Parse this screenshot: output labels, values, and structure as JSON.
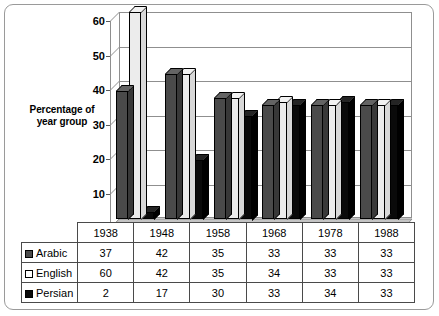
{
  "chart_data": {
    "type": "bar",
    "title": "",
    "subtitle": "",
    "xlabel": "",
    "ylabel": "Percentage of\nyear group",
    "ylabel_lines": [
      "Percentage of",
      "year group"
    ],
    "categories": [
      "1938",
      "1948",
      "1958",
      "1968",
      "1978",
      "1988"
    ],
    "series": [
      {
        "name": "Arabic",
        "values": [
          37,
          42,
          35,
          33,
          33,
          33
        ],
        "color": "#4a4a4a",
        "swatch": "gray-swatch"
      },
      {
        "name": "English",
        "values": [
          60,
          42,
          35,
          34,
          33,
          33
        ],
        "color": "#ffffff",
        "swatch": "white-swatch"
      },
      {
        "name": "Persian",
        "values": [
          2,
          17,
          30,
          33,
          34,
          33
        ],
        "color": "#0a0a0a",
        "swatch": "black-swatch"
      }
    ],
    "ylim": [
      0,
      60
    ],
    "ytick_values": [
      0,
      10,
      20,
      30,
      40,
      50,
      60
    ],
    "ytick_labels": [
      "0",
      "10",
      "20",
      "30",
      "40",
      "50",
      "60"
    ],
    "grid": true,
    "grid_axis": "y",
    "legend_position": "table-row-headers",
    "style": "3d-clustered-column",
    "has_data_table": true
  },
  "table": {
    "column_headers": [
      "1938",
      "1948",
      "1958",
      "1968",
      "1978",
      "1988"
    ],
    "rows": [
      {
        "label": "Arabic",
        "values": [
          "37",
          "42",
          "35",
          "33",
          "33",
          "33"
        ]
      },
      {
        "label": "English",
        "values": [
          "60",
          "42",
          "35",
          "34",
          "33",
          "33"
        ]
      },
      {
        "label": "Persian",
        "values": [
          "2",
          "17",
          "30",
          "33",
          "34",
          "33"
        ]
      }
    ]
  },
  "colors": {
    "arabic": "#4a4a4a",
    "english": "#ffffff",
    "persian": "#0a0a0a",
    "gridline": "#8f8f8f",
    "frame": "#9a9a9a",
    "table_border": "#4a4a4a",
    "floor": "#b8b8b8"
  }
}
